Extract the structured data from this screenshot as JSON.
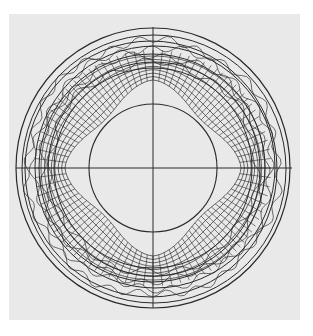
{
  "figure": {
    "panel": {
      "x": 9,
      "y": 14,
      "width": 291,
      "height": 306,
      "color": "#e9e9e9"
    },
    "ink_color": "#2a2a2a",
    "center": {
      "x": 153,
      "y": 168
    },
    "axes": {
      "horizontal": {
        "y": 168,
        "x1": 16,
        "x2": 292
      },
      "vertical": {
        "x": 153,
        "y1": 27,
        "y2": 308
      }
    },
    "inner_circle": {
      "r": 64
    },
    "outer_rings": [
      {
        "rx": 137,
        "ry": 140,
        "dx": 0,
        "dy": 0
      },
      {
        "rx": 132,
        "ry": 134,
        "dx": 1,
        "dy": 1
      },
      {
        "rx": 126,
        "ry": 128,
        "dx": -2,
        "dy": 1
      },
      {
        "rx": 120,
        "ry": 121,
        "dx": 2,
        "dy": -1
      },
      {
        "rx": 113,
        "ry": 114,
        "dx": -1,
        "dy": 0
      },
      {
        "rx": 106,
        "ry": 107,
        "dx": 1,
        "dy": 1
      },
      {
        "rx": 99,
        "ry": 100,
        "dx": 0,
        "dy": 0
      }
    ],
    "mesh": {
      "inner_radius_axis": 88,
      "inner_radius_diagonal": 68,
      "outer_radius": 112,
      "ring_count": 7,
      "radial_count": 96
    }
  }
}
